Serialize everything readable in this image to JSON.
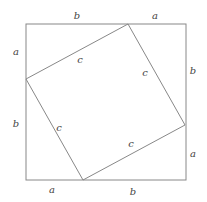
{
  "diagram": {
    "outer_square": {
      "x1": 26,
      "y1": 24,
      "x2": 186,
      "y2": 180
    },
    "inner_square": {
      "points": "128,24 185,125 83,180 26,79"
    },
    "stroke_color": "#888888",
    "labels": [
      {
        "id": "top-b",
        "text": "b",
        "x": 77,
        "y": 19
      },
      {
        "id": "top-a",
        "text": "a",
        "x": 155,
        "y": 19
      },
      {
        "id": "left-a",
        "text": "a",
        "x": 16,
        "y": 55
      },
      {
        "id": "left-b",
        "text": "b",
        "x": 16,
        "y": 127
      },
      {
        "id": "right-b",
        "text": "b",
        "x": 193,
        "y": 74
      },
      {
        "id": "right-a",
        "text": "a",
        "x": 193,
        "y": 157
      },
      {
        "id": "bottom-a",
        "text": "a",
        "x": 52,
        "y": 193
      },
      {
        "id": "bottom-b",
        "text": "b",
        "x": 133,
        "y": 195
      },
      {
        "id": "inner-top-c",
        "text": "c",
        "x": 80,
        "y": 63
      },
      {
        "id": "inner-right-c",
        "text": "c",
        "x": 145,
        "y": 76
      },
      {
        "id": "inner-left-c",
        "text": "c",
        "x": 59,
        "y": 131
      },
      {
        "id": "inner-bottom-c",
        "text": "c",
        "x": 131,
        "y": 147
      }
    ]
  }
}
